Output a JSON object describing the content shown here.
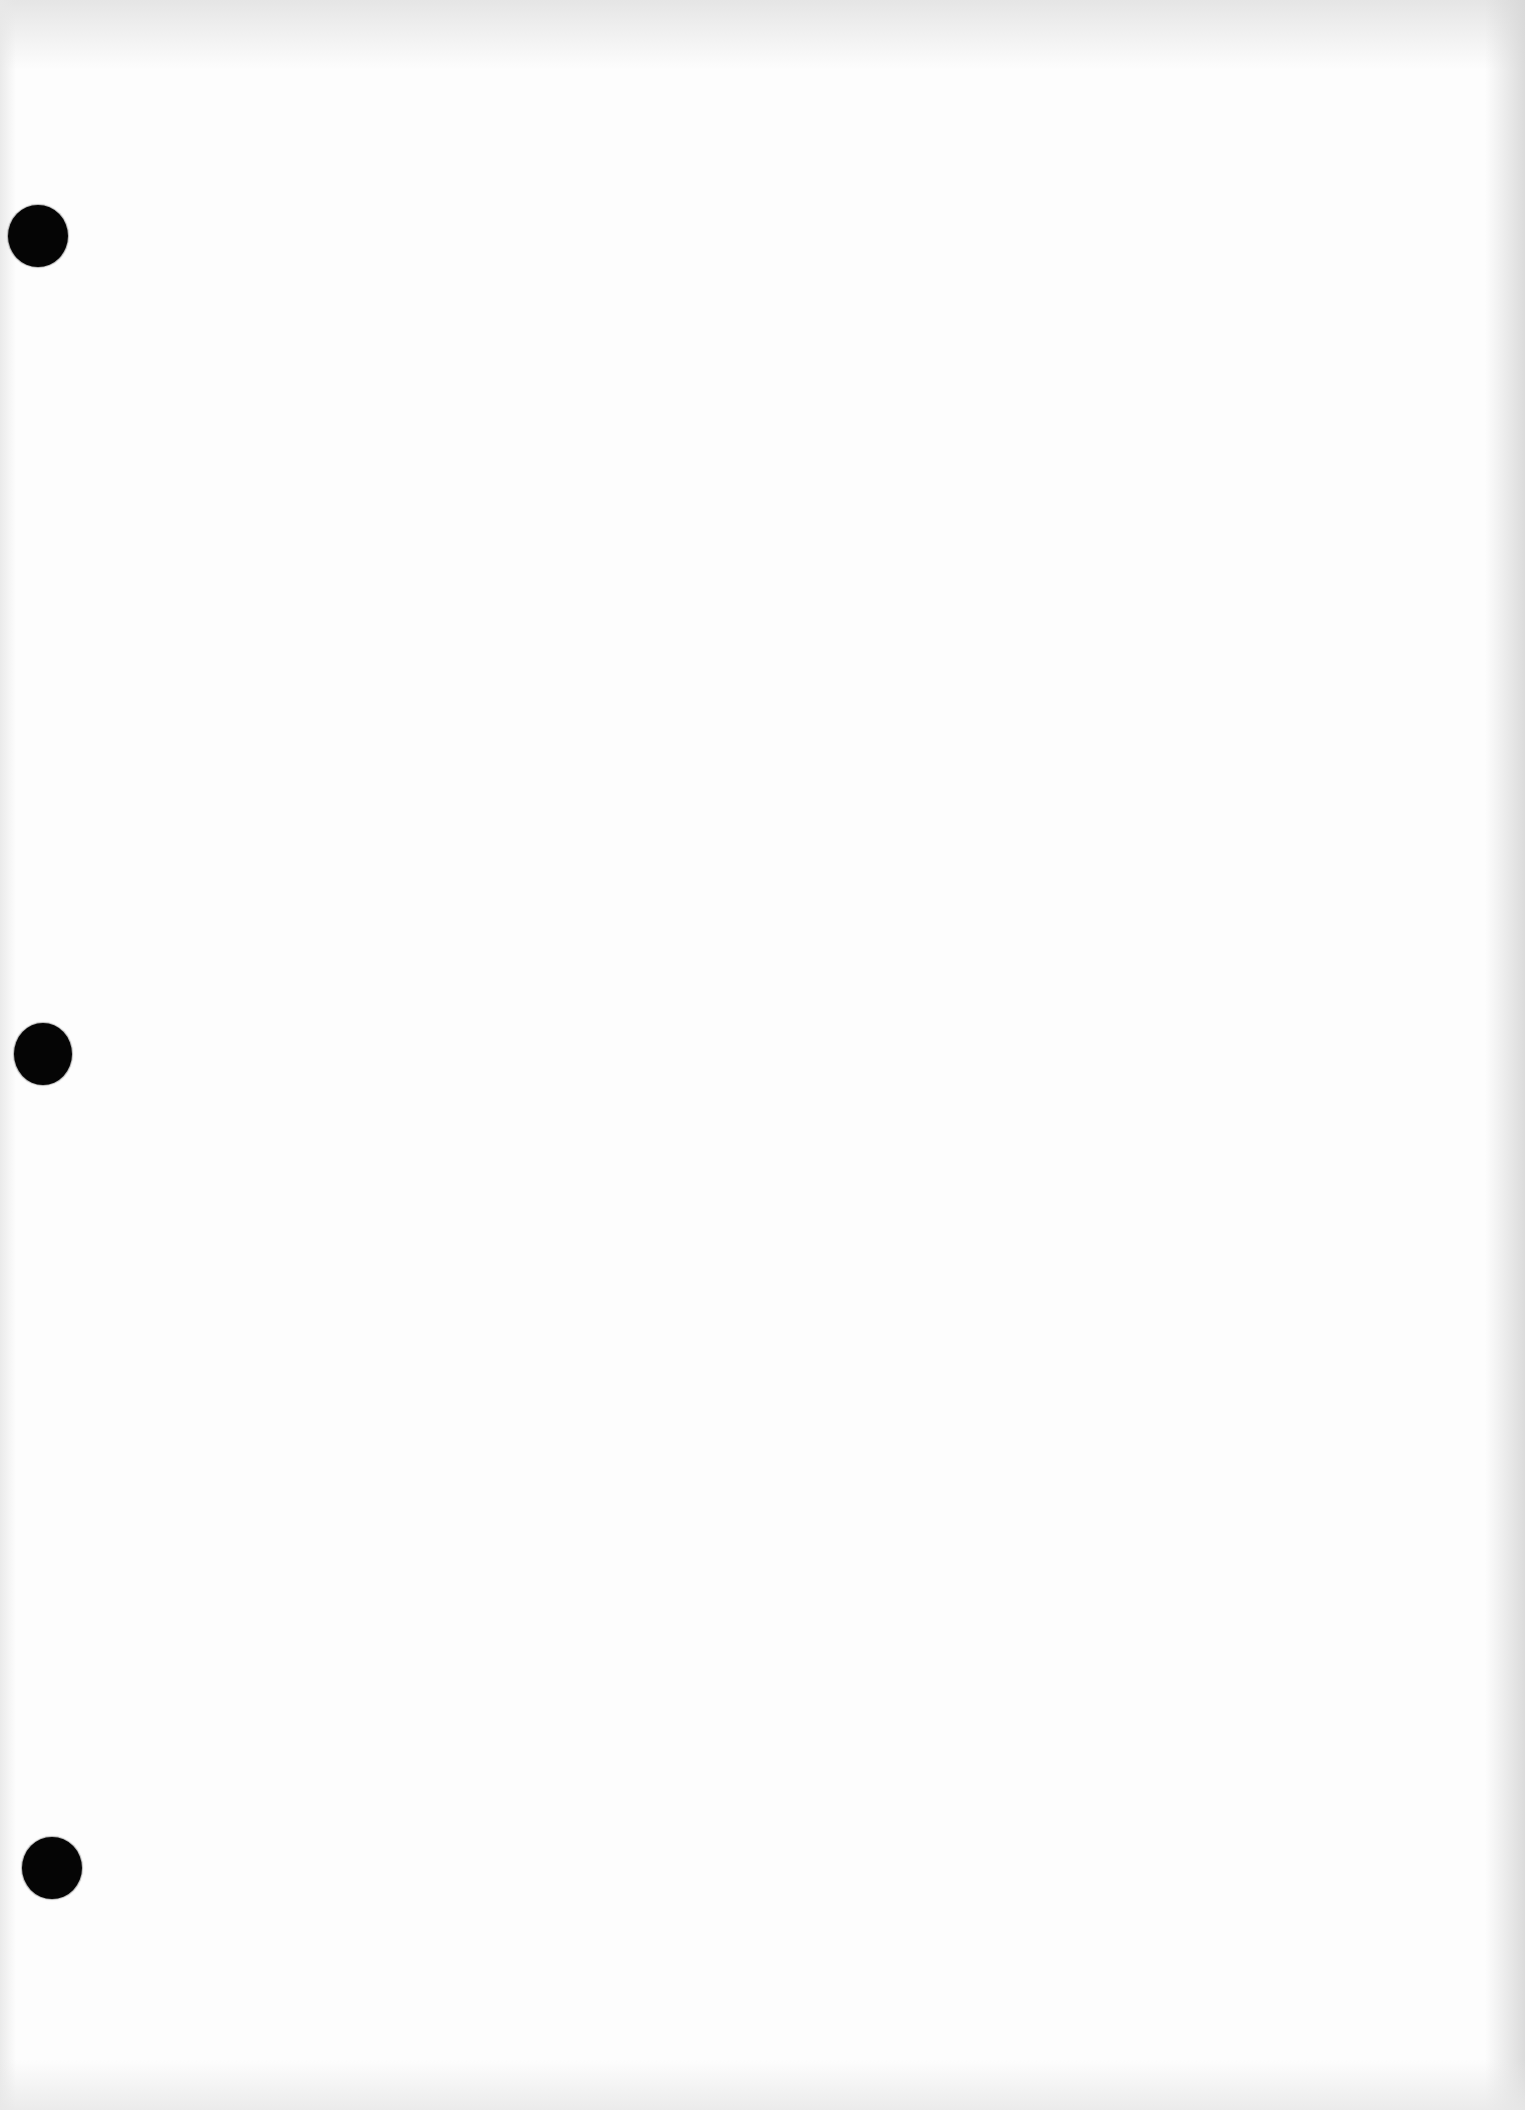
{
  "document": {
    "type": "blank-scanned-page",
    "text_content": "",
    "colors": {
      "paper": "#fdfdfd",
      "edge_shading": "#dcdcdc",
      "punch_hole": "#050505"
    },
    "punch_holes": [
      {
        "cx": 38,
        "cy": 236,
        "w": 60,
        "h": 62
      },
      {
        "cx": 43,
        "cy": 1054,
        "w": 58,
        "h": 62
      },
      {
        "cx": 52,
        "cy": 1868,
        "w": 60,
        "h": 62
      }
    ]
  }
}
